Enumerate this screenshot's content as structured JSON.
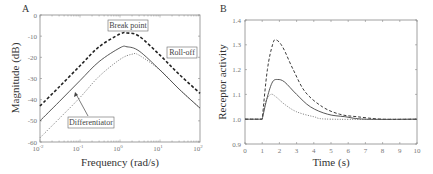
{
  "chart_data": [
    {
      "panel": "A",
      "type": "line",
      "xscale": "log",
      "xlabel": "Frequency (rad/s)",
      "ylabel": "Magnitude (dB)",
      "xlim": [
        0.01,
        100
      ],
      "ylim": [
        -60,
        0
      ],
      "xticks": [
        "10^-2",
        "10^-1",
        "10^0",
        "10^1",
        "10^2"
      ],
      "yticks": [
        0,
        -10,
        -20,
        -30,
        -40,
        -50,
        -60
      ],
      "annotations": [
        "Break point",
        "Roll-off",
        "Differentiator"
      ],
      "series": [
        {
          "name": "dashed (thick)",
          "style": "dashed",
          "x": [
            0.01,
            0.03,
            0.1,
            0.3,
            1,
            1.5,
            3,
            10,
            30,
            100
          ],
          "values": [
            -43,
            -34,
            -24,
            -15,
            -9,
            -8.5,
            -10,
            -19,
            -28,
            -37
          ]
        },
        {
          "name": "solid",
          "style": "solid",
          "x": [
            0.01,
            0.03,
            0.1,
            0.3,
            1,
            1.5,
            3,
            10,
            30,
            100
          ],
          "values": [
            -50,
            -41,
            -31,
            -22,
            -15.5,
            -15,
            -17,
            -26,
            -35,
            -44
          ]
        },
        {
          "name": "dotted",
          "style": "dotted",
          "x": [
            0.01,
            0.03,
            0.1,
            0.3,
            1,
            2,
            3,
            10,
            30,
            100
          ],
          "values": [
            -58,
            -49,
            -39,
            -29,
            -21,
            -18.5,
            -19,
            -26,
            -35,
            -44
          ]
        }
      ]
    },
    {
      "panel": "B",
      "type": "line",
      "xlabel": "Time (s)",
      "ylabel": "Receptor activity",
      "xlim": [
        0,
        10
      ],
      "ylim": [
        0.9,
        1.4
      ],
      "xticks": [
        0,
        1,
        2,
        3,
        4,
        5,
        6,
        7,
        8,
        9,
        10
      ],
      "yticks": [
        "0.9",
        "1.0",
        "1.1",
        "1.2",
        "1.3",
        "1.4"
      ],
      "series": [
        {
          "name": "dashed",
          "style": "dashed",
          "x": [
            0,
            1,
            1.3,
            1.6,
            1.8,
            2.2,
            2.8,
            3.5,
            4.5,
            5.5,
            6.5,
            8,
            10
          ],
          "values": [
            1.0,
            1.0,
            1.2,
            1.3,
            1.32,
            1.29,
            1.2,
            1.11,
            1.05,
            1.02,
            1.01,
            1.0,
            1.0
          ]
        },
        {
          "name": "solid",
          "style": "solid",
          "x": [
            0,
            1,
            1.3,
            1.6,
            1.9,
            2.3,
            3,
            3.8,
            4.8,
            5.8,
            7,
            10
          ],
          "values": [
            1.0,
            1.0,
            1.09,
            1.15,
            1.16,
            1.15,
            1.1,
            1.05,
            1.02,
            1.01,
            1.0,
            1.0
          ]
        },
        {
          "name": "dotted",
          "style": "dotted",
          "x": [
            0,
            1,
            1.2,
            1.5,
            1.8,
            2.3,
            3,
            4,
            5,
            10
          ],
          "values": [
            1.0,
            1.0,
            1.07,
            1.1,
            1.09,
            1.06,
            1.03,
            1.01,
            1.0,
            1.0
          ]
        }
      ]
    }
  ]
}
